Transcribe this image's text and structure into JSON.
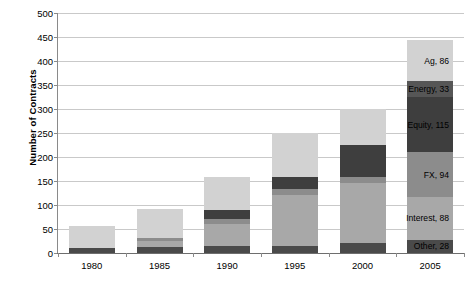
{
  "chart_data": {
    "type": "bar",
    "stacked": true,
    "title": "",
    "xlabel": "",
    "ylabel": "Number of Contracts",
    "categories": [
      "1980",
      "1985",
      "1990",
      "1995",
      "2000",
      "2005"
    ],
    "ylim": [
      0,
      500
    ],
    "yticks": [
      0,
      50,
      100,
      150,
      200,
      250,
      300,
      350,
      400,
      450,
      500
    ],
    "grid": true,
    "legend": "none",
    "series": [
      {
        "name": "Other",
        "color": "#4a4a4a",
        "values": [
          10,
          12,
          14,
          15,
          20,
          28
        ]
      },
      {
        "name": "Interest",
        "color": "#a8a8a8",
        "values": [
          0,
          14,
          46,
          105,
          125,
          88
        ]
      },
      {
        "name": "FX",
        "color": "#8c8c8c",
        "values": [
          0,
          6,
          10,
          14,
          14,
          94
        ]
      },
      {
        "name": "Equity",
        "color": "#3e3e3e",
        "values": [
          0,
          0,
          20,
          25,
          66,
          115
        ]
      },
      {
        "name": "Energy",
        "color": "#565656",
        "values": [
          0,
          0,
          0,
          0,
          0,
          33
        ]
      },
      {
        "name": "Ag",
        "color": "#d2d2d2",
        "values": [
          47,
          60,
          68,
          91,
          75,
          86
        ]
      }
    ],
    "totals": [
      57,
      92,
      158,
      250,
      300,
      444
    ],
    "annotations": [
      {
        "text": "Ag, 86",
        "series": "Ag",
        "value": 86
      },
      {
        "text": "Energy, 33",
        "series": "Energy",
        "value": 33
      },
      {
        "text": "Equity, 115",
        "series": "Equity",
        "value": 115
      },
      {
        "text": "FX, 94",
        "series": "FX",
        "value": 94
      },
      {
        "text": "Interest, 88",
        "series": "Interest",
        "value": 88
      },
      {
        "text": "Other, 28",
        "series": "Other",
        "value": 28
      }
    ],
    "annotation_category": "2005"
  },
  "colors": {
    "gridline": "#c9c9c9",
    "axis": "#8a8a8a",
    "background": "#ffffff",
    "text": "#000000"
  }
}
